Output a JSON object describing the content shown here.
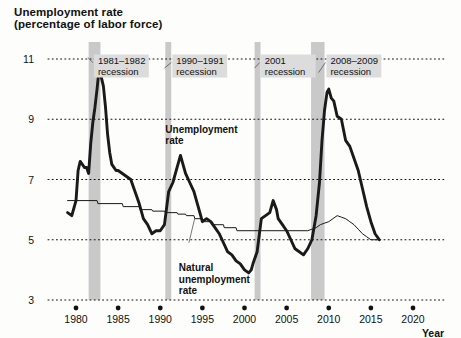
{
  "chart_data": {
    "type": "line",
    "title": "Unemployment rate",
    "subtitle": "(percentage of labor force)",
    "xlabel": "Year",
    "ylabel": "",
    "xlim": [
      1978.5,
      2021.5
    ],
    "ylim": [
      3,
      11.6
    ],
    "xticks": [
      1980,
      1985,
      1990,
      1995,
      2000,
      2005,
      2010,
      2015,
      2020
    ],
    "yticks": [
      3,
      5,
      7,
      9,
      11
    ],
    "grid": "horizontal-dotted",
    "legend": "inline-annotations",
    "series": [
      {
        "name": "Unemployment rate",
        "color": "#1a1a1a",
        "width": 2.9,
        "label_x": 1990.6,
        "label_y": 8.55,
        "points": [
          [
            1979.0,
            5.9
          ],
          [
            1979.5,
            5.8
          ],
          [
            1980.0,
            6.3
          ],
          [
            1980.25,
            7.3
          ],
          [
            1980.5,
            7.6
          ],
          [
            1980.75,
            7.5
          ],
          [
            1981.0,
            7.4
          ],
          [
            1981.25,
            7.4
          ],
          [
            1981.5,
            7.2
          ],
          [
            1981.75,
            8.2
          ],
          [
            1982.0,
            8.9
          ],
          [
            1982.25,
            9.4
          ],
          [
            1982.5,
            10.0
          ],
          [
            1982.75,
            10.7
          ],
          [
            1983.0,
            10.4
          ],
          [
            1983.25,
            10.1
          ],
          [
            1983.5,
            9.4
          ],
          [
            1983.75,
            8.5
          ],
          [
            1984.0,
            7.9
          ],
          [
            1984.25,
            7.5
          ],
          [
            1984.5,
            7.4
          ],
          [
            1984.75,
            7.3
          ],
          [
            1985.0,
            7.3
          ],
          [
            1985.5,
            7.2
          ],
          [
            1986.0,
            7.1
          ],
          [
            1986.5,
            7.0
          ],
          [
            1987.0,
            6.6
          ],
          [
            1987.5,
            6.2
          ],
          [
            1988.0,
            5.7
          ],
          [
            1988.5,
            5.5
          ],
          [
            1989.0,
            5.2
          ],
          [
            1989.5,
            5.3
          ],
          [
            1990.0,
            5.3
          ],
          [
            1990.5,
            5.5
          ],
          [
            1991.0,
            6.6
          ],
          [
            1991.5,
            6.9
          ],
          [
            1992.0,
            7.4
          ],
          [
            1992.4,
            7.8
          ],
          [
            1992.8,
            7.4
          ],
          [
            1993.0,
            7.2
          ],
          [
            1993.5,
            6.9
          ],
          [
            1994.0,
            6.6
          ],
          [
            1994.5,
            6.1
          ],
          [
            1995.0,
            5.6
          ],
          [
            1995.5,
            5.7
          ],
          [
            1996.0,
            5.6
          ],
          [
            1996.5,
            5.4
          ],
          [
            1997.0,
            5.2
          ],
          [
            1997.5,
            4.9
          ],
          [
            1998.0,
            4.6
          ],
          [
            1998.5,
            4.5
          ],
          [
            1999.0,
            4.3
          ],
          [
            1999.5,
            4.2
          ],
          [
            2000.0,
            4.0
          ],
          [
            2000.5,
            3.9
          ],
          [
            2000.8,
            4.0
          ],
          [
            2001.0,
            4.2
          ],
          [
            2001.5,
            4.6
          ],
          [
            2002.0,
            5.7
          ],
          [
            2002.5,
            5.8
          ],
          [
            2003.0,
            5.9
          ],
          [
            2003.4,
            6.3
          ],
          [
            2003.8,
            6.0
          ],
          [
            2004.0,
            5.7
          ],
          [
            2004.5,
            5.5
          ],
          [
            2005.0,
            5.3
          ],
          [
            2005.5,
            5.0
          ],
          [
            2006.0,
            4.7
          ],
          [
            2006.5,
            4.6
          ],
          [
            2007.0,
            4.5
          ],
          [
            2007.5,
            4.7
          ],
          [
            2008.0,
            5.0
          ],
          [
            2008.5,
            5.8
          ],
          [
            2008.9,
            6.9
          ],
          [
            2009.2,
            8.3
          ],
          [
            2009.5,
            9.3
          ],
          [
            2009.8,
            9.9
          ],
          [
            2010.0,
            10.0
          ],
          [
            2010.3,
            9.7
          ],
          [
            2010.6,
            9.6
          ],
          [
            2011.0,
            9.1
          ],
          [
            2011.5,
            9.0
          ],
          [
            2012.0,
            8.3
          ],
          [
            2012.5,
            8.1
          ],
          [
            2013.0,
            7.7
          ],
          [
            2013.5,
            7.3
          ],
          [
            2014.0,
            6.7
          ],
          [
            2014.5,
            6.1
          ],
          [
            2015.0,
            5.6
          ],
          [
            2015.5,
            5.2
          ],
          [
            2016.0,
            5.0
          ]
        ]
      },
      {
        "name": "Natural unemployment rate",
        "color": "#1a1a1a",
        "width": 1.0,
        "label_x": 1992.2,
        "label_y": 3.95,
        "points": [
          [
            1979.0,
            6.3
          ],
          [
            1982.5,
            6.3
          ],
          [
            1982.6,
            6.2
          ],
          [
            1985.5,
            6.2
          ],
          [
            1985.6,
            6.1
          ],
          [
            1987.5,
            6.1
          ],
          [
            1987.6,
            6.0
          ],
          [
            1989.0,
            6.0
          ],
          [
            1989.1,
            5.95
          ],
          [
            1990.5,
            5.95
          ],
          [
            1990.6,
            5.9
          ],
          [
            1992.0,
            5.9
          ],
          [
            1992.1,
            5.85
          ],
          [
            1993.0,
            5.85
          ],
          [
            1993.1,
            5.8
          ],
          [
            1994.0,
            5.8
          ],
          [
            1994.1,
            5.7
          ],
          [
            1995.0,
            5.7
          ],
          [
            1995.1,
            5.6
          ],
          [
            1996.0,
            5.6
          ],
          [
            1996.1,
            5.5
          ],
          [
            1997.5,
            5.5
          ],
          [
            1997.6,
            5.4
          ],
          [
            1999.0,
            5.4
          ],
          [
            1999.1,
            5.3
          ],
          [
            2001.0,
            5.3
          ],
          [
            2007.5,
            5.3
          ],
          [
            2008.0,
            5.35
          ],
          [
            2008.5,
            5.4
          ],
          [
            2009.0,
            5.5
          ],
          [
            2009.5,
            5.55
          ],
          [
            2010.0,
            5.6
          ],
          [
            2010.5,
            5.7
          ],
          [
            2011.0,
            5.8
          ],
          [
            2011.5,
            5.75
          ],
          [
            2012.0,
            5.7
          ],
          [
            2012.5,
            5.6
          ],
          [
            2013.0,
            5.5
          ],
          [
            2013.5,
            5.35
          ],
          [
            2014.0,
            5.2
          ],
          [
            2014.5,
            5.1
          ],
          [
            2015.0,
            5.0
          ],
          [
            2016.0,
            5.0
          ]
        ]
      }
    ],
    "recessions": [
      {
        "label_line1": "1981–1982",
        "label_line2": "recession",
        "start": 1981.5,
        "end": 1982.9,
        "label_x": 1982.6,
        "label_y": 10.85,
        "leader_to_x": 1981.4,
        "leader_to_y": 11.05
      },
      {
        "label_line1": "1990–1991",
        "label_line2": "recession",
        "start": 1990.6,
        "end": 1991.3,
        "label_x": 1991.9,
        "label_y": 10.85,
        "leader_to_x": 1990.5,
        "leader_to_y": 10.7
      },
      {
        "label_line1": "2001",
        "label_line2": "recession",
        "start": 2001.2,
        "end": 2001.9,
        "label_x": 2002.4,
        "label_y": 10.85,
        "leader_to_x": 2001.2,
        "leader_to_y": 10.7
      },
      {
        "label_line1": "2008–2009",
        "label_line2": "recession",
        "start": 2007.9,
        "end": 2009.5,
        "label_x": 2010.2,
        "label_y": 10.85,
        "leader_to_x": 2008.8,
        "leader_to_y": 10.55
      }
    ],
    "recession_band_color": "#c9c9c9",
    "recession_label_bg": "#dcdcdc",
    "gridline_color": "#111111"
  }
}
